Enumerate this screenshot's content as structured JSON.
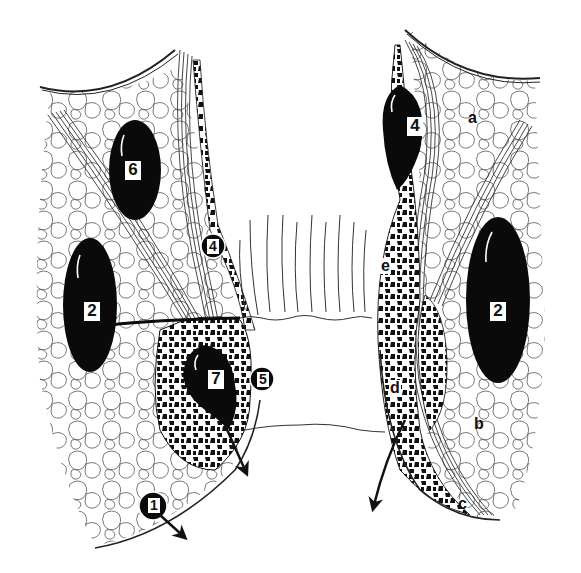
{
  "figure": {
    "colors": {
      "ink": "#111111",
      "background": "#ffffff",
      "fat_lobule_stroke": "#555555"
    }
  },
  "abscess_labels": [
    {
      "id": "left-6",
      "text": "6",
      "side": "left",
      "x": 133,
      "y": 163
    },
    {
      "id": "left-2",
      "text": "2",
      "side": "left",
      "x": 84,
      "y": 302
    },
    {
      "id": "left-4",
      "text": "4",
      "side": "left",
      "x": 209,
      "y": 239,
      "style": "small"
    },
    {
      "id": "left-7",
      "text": "7",
      "side": "left",
      "x": 208,
      "y": 373
    },
    {
      "id": "left-5",
      "text": "5",
      "side": "left",
      "x": 258,
      "y": 373,
      "style": "small"
    },
    {
      "id": "left-1",
      "text": "1",
      "side": "left",
      "x": 149,
      "y": 497,
      "style": "small"
    },
    {
      "id": "right-4",
      "text": "4",
      "side": "right",
      "x": 407,
      "y": 117
    },
    {
      "id": "right-2",
      "text": "2",
      "side": "right",
      "x": 490,
      "y": 303
    }
  ],
  "region_labels": [
    {
      "id": "a",
      "text": "a",
      "x": 468,
      "y": 109
    },
    {
      "id": "b",
      "text": "b",
      "x": 474,
      "y": 415
    },
    {
      "id": "c",
      "text": "c",
      "x": 458,
      "y": 494
    },
    {
      "id": "d",
      "text": "d",
      "x": 391,
      "y": 379,
      "boxed": true
    },
    {
      "id": "e",
      "text": "e",
      "x": 380,
      "y": 257,
      "boxed": true
    }
  ]
}
